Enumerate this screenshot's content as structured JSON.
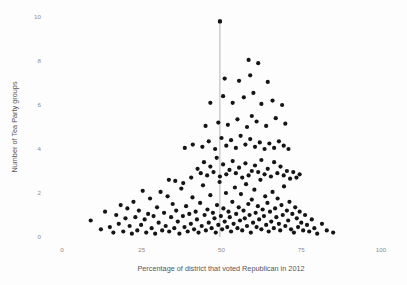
{
  "chart_data": {
    "type": "scatter",
    "title": "",
    "xlabel": "Percentage of district that voted Republican in 2012",
    "ylabel": "Number of Tea Party groups",
    "xlim": [
      0,
      100
    ],
    "ylim": [
      0,
      10
    ],
    "xticks": [
      0,
      25,
      50,
      75,
      100
    ],
    "xtick_labels": [
      "0",
      "25",
      "50",
      "75",
      "100"
    ],
    "yticks": [
      0,
      2,
      4,
      6,
      8,
      10
    ],
    "ytick_labels": [
      "0",
      "2",
      "4",
      "6",
      "8",
      "10"
    ],
    "grid": false,
    "legend": false,
    "marker_color": "#151515",
    "marker_size": 2.1,
    "annotation": {
      "type": "vertical-line",
      "x": 49.5,
      "y_top": 9.8,
      "y_bottom": 0,
      "color": "#b4b4b8",
      "cap_marker": true
    },
    "points": [
      [
        9.0,
        0.75
      ],
      [
        12.2,
        0.35
      ],
      [
        13.5,
        1.15
      ],
      [
        15.0,
        0.45
      ],
      [
        16.1,
        0.2
      ],
      [
        17.0,
        1.0
      ],
      [
        17.8,
        0.6
      ],
      [
        18.4,
        1.45
      ],
      [
        19.2,
        0.25
      ],
      [
        19.9,
        0.85
      ],
      [
        20.5,
        1.3
      ],
      [
        21.2,
        0.5
      ],
      [
        21.9,
        0.15
      ],
      [
        22.4,
        1.6
      ],
      [
        23.0,
        0.9
      ],
      [
        23.6,
        0.3
      ],
      [
        24.1,
        1.2
      ],
      [
        24.8,
        0.55
      ],
      [
        25.3,
        2.1
      ],
      [
        25.9,
        0.8
      ],
      [
        26.4,
        0.2
      ],
      [
        27.0,
        1.05
      ],
      [
        27.6,
        1.75
      ],
      [
        28.1,
        0.4
      ],
      [
        28.7,
        0.95
      ],
      [
        29.2,
        0.15
      ],
      [
        29.8,
        1.35
      ],
      [
        30.3,
        0.65
      ],
      [
        30.9,
        2.05
      ],
      [
        31.4,
        0.3
      ],
      [
        32.0,
        1.1
      ],
      [
        32.5,
        0.5
      ],
      [
        33.1,
        1.85
      ],
      [
        33.6,
        0.25
      ],
      [
        34.2,
        0.9
      ],
      [
        34.7,
        1.5
      ],
      [
        35.2,
        0.4
      ],
      [
        35.8,
        1.2
      ],
      [
        36.3,
        0.7
      ],
      [
        36.8,
        0.15
      ],
      [
        37.4,
        2.2
      ],
      [
        37.9,
        0.95
      ],
      [
        38.4,
        0.45
      ],
      [
        38.9,
        1.4
      ],
      [
        39.4,
        0.25
      ],
      [
        39.9,
        1.05
      ],
      [
        40.4,
        0.6
      ],
      [
        40.9,
        1.8
      ],
      [
        41.4,
        0.35
      ],
      [
        41.9,
        1.15
      ],
      [
        42.3,
        0.8
      ],
      [
        42.8,
        0.2
      ],
      [
        43.3,
        1.55
      ],
      [
        43.8,
        0.5
      ],
      [
        44.2,
        2.35
      ],
      [
        44.7,
        1.0
      ],
      [
        45.1,
        0.3
      ],
      [
        45.6,
        1.25
      ],
      [
        46.0,
        0.65
      ],
      [
        46.5,
        1.9
      ],
      [
        46.9,
        0.4
      ],
      [
        47.3,
        1.1
      ],
      [
        47.8,
        0.85
      ],
      [
        48.2,
        0.2
      ],
      [
        48.6,
        1.45
      ],
      [
        49.0,
        0.55
      ],
      [
        49.4,
        2.5
      ],
      [
        49.8,
        0.95
      ],
      [
        50.2,
        0.35
      ],
      [
        50.6,
        1.3
      ],
      [
        51.0,
        0.7
      ],
      [
        51.4,
        2.0
      ],
      [
        51.8,
        0.45
      ],
      [
        52.2,
        1.15
      ],
      [
        52.6,
        0.9
      ],
      [
        53.0,
        0.25
      ],
      [
        53.4,
        1.6
      ],
      [
        53.8,
        0.6
      ],
      [
        54.2,
        2.25
      ],
      [
        54.6,
        1.05
      ],
      [
        55.0,
        0.4
      ],
      [
        55.4,
        1.35
      ],
      [
        55.8,
        0.75
      ],
      [
        56.1,
        1.95
      ],
      [
        56.5,
        0.3
      ],
      [
        56.9,
        1.2
      ],
      [
        57.3,
        0.85
      ],
      [
        57.7,
        2.4
      ],
      [
        58.0,
        0.5
      ],
      [
        58.4,
        1.5
      ],
      [
        58.8,
        1.0
      ],
      [
        59.2,
        0.2
      ],
      [
        59.5,
        1.7
      ],
      [
        59.9,
        0.65
      ],
      [
        60.3,
        2.15
      ],
      [
        60.7,
        1.1
      ],
      [
        61.0,
        0.45
      ],
      [
        61.4,
        1.4
      ],
      [
        61.8,
        0.8
      ],
      [
        62.2,
        2.6
      ],
      [
        62.5,
        0.35
      ],
      [
        62.9,
        1.25
      ],
      [
        63.3,
        0.95
      ],
      [
        63.7,
        1.85
      ],
      [
        64.0,
        0.55
      ],
      [
        64.4,
        1.55
      ],
      [
        64.8,
        0.25
      ],
      [
        65.2,
        1.15
      ],
      [
        65.6,
        0.7
      ],
      [
        66.0,
        2.05
      ],
      [
        66.4,
        0.4
      ],
      [
        66.8,
        1.3
      ],
      [
        67.2,
        0.9
      ],
      [
        67.6,
        1.75
      ],
      [
        68.0,
        0.6
      ],
      [
        68.4,
        0.3
      ],
      [
        68.8,
        1.45
      ],
      [
        69.2,
        1.0
      ],
      [
        69.6,
        2.3
      ],
      [
        70.0,
        0.5
      ],
      [
        70.5,
        1.2
      ],
      [
        70.9,
        0.75
      ],
      [
        71.3,
        1.6
      ],
      [
        71.8,
        0.35
      ],
      [
        72.2,
        1.05
      ],
      [
        72.7,
        0.2
      ],
      [
        73.1,
        1.35
      ],
      [
        73.6,
        0.85
      ],
      [
        74.0,
        0.45
      ],
      [
        74.5,
        1.15
      ],
      [
        75.0,
        0.65
      ],
      [
        75.6,
        0.3
      ],
      [
        76.2,
        1.0
      ],
      [
        76.8,
        0.55
      ],
      [
        77.5,
        0.25
      ],
      [
        78.3,
        0.8
      ],
      [
        79.1,
        0.4
      ],
      [
        80.0,
        0.15
      ],
      [
        81.5,
        0.6
      ],
      [
        83.0,
        0.3
      ],
      [
        85.0,
        0.2
      ],
      [
        33.5,
        2.6
      ],
      [
        35.5,
        2.55
      ],
      [
        38.0,
        2.45
      ],
      [
        40.5,
        2.7
      ],
      [
        42.5,
        3.1
      ],
      [
        43.5,
        2.9
      ],
      [
        44.5,
        3.4
      ],
      [
        45.5,
        2.8
      ],
      [
        46.5,
        3.2
      ],
      [
        47.5,
        2.95
      ],
      [
        48.5,
        3.6
      ],
      [
        49.5,
        2.75
      ],
      [
        50.5,
        3.3
      ],
      [
        51.5,
        2.85
      ],
      [
        52.5,
        3.05
      ],
      [
        53.5,
        3.45
      ],
      [
        54.5,
        2.9
      ],
      [
        55.5,
        3.15
      ],
      [
        56.5,
        2.7
      ],
      [
        57.5,
        3.35
      ],
      [
        58.5,
        2.8
      ],
      [
        59.5,
        3.0
      ],
      [
        60.5,
        3.25
      ],
      [
        61.5,
        2.95
      ],
      [
        62.5,
        3.5
      ],
      [
        63.5,
        2.85
      ],
      [
        64.5,
        3.1
      ],
      [
        65.5,
        2.75
      ],
      [
        66.5,
        3.4
      ],
      [
        67.5,
        2.9
      ],
      [
        68.5,
        3.2
      ],
      [
        69.5,
        2.8
      ],
      [
        70.5,
        3.0
      ],
      [
        71.5,
        2.65
      ],
      [
        72.5,
        2.95
      ],
      [
        73.5,
        2.7
      ],
      [
        74.5,
        2.85
      ],
      [
        44.0,
        4.1
      ],
      [
        46.0,
        4.35
      ],
      [
        48.0,
        4.0
      ],
      [
        50.0,
        4.5
      ],
      [
        51.5,
        4.15
      ],
      [
        53.0,
        4.4
      ],
      [
        54.5,
        4.05
      ],
      [
        56.0,
        4.6
      ],
      [
        57.5,
        4.2
      ],
      [
        59.0,
        4.45
      ],
      [
        60.5,
        4.1
      ],
      [
        62.0,
        4.3
      ],
      [
        63.5,
        4.0
      ],
      [
        65.0,
        4.25
      ],
      [
        66.5,
        4.05
      ],
      [
        68.0,
        4.35
      ],
      [
        69.5,
        4.15
      ],
      [
        71.0,
        4.0
      ],
      [
        41.0,
        4.2
      ],
      [
        38.5,
        4.05
      ],
      [
        52.0,
        5.1
      ],
      [
        55.0,
        5.35
      ],
      [
        58.0,
        5.0
      ],
      [
        61.0,
        5.25
      ],
      [
        64.0,
        5.05
      ],
      [
        67.0,
        5.4
      ],
      [
        49.0,
        5.2
      ],
      [
        45.0,
        5.05
      ],
      [
        70.0,
        5.15
      ],
      [
        59.5,
        5.5
      ],
      [
        53.5,
        6.1
      ],
      [
        57.0,
        6.35
      ],
      [
        62.5,
        6.05
      ],
      [
        66.0,
        6.2
      ],
      [
        50.5,
        6.4
      ],
      [
        46.5,
        6.1
      ],
      [
        60.0,
        6.55
      ],
      [
        69.0,
        6.0
      ],
      [
        55.5,
        7.1
      ],
      [
        59.0,
        7.35
      ],
      [
        64.5,
        7.05
      ],
      [
        51.0,
        7.2
      ],
      [
        58.5,
        8.05
      ],
      [
        61.5,
        7.9
      ],
      [
        49.5,
        9.8
      ]
    ]
  },
  "accessibility": {
    "description": "Scatter plot of number of Tea Party groups versus percentage of district that voted Republican in 2012"
  }
}
